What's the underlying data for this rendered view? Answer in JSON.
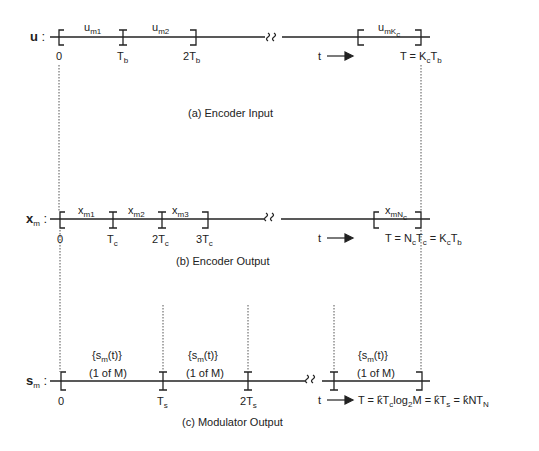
{
  "diagram": {
    "panels": [
      {
        "id": "a",
        "row_label": "u",
        "caption": "(a) Encoder Input",
        "segments": [
          "u_m1",
          "u_m2",
          "u_mKc"
        ],
        "ticks": [
          "0",
          "T_b",
          "2T_b"
        ],
        "end_formula": "T = K_c T_b",
        "time_label": "t"
      },
      {
        "id": "b",
        "row_label": "x_m",
        "caption": "(b) Encoder Output",
        "segments": [
          "x_m1",
          "x_m2",
          "x_m3",
          "x_mNc"
        ],
        "ticks": [
          "0",
          "T_c",
          "2T_c",
          "3T_c"
        ],
        "end_formula": "T = N_c T_c = K_c T_b",
        "time_label": "t"
      },
      {
        "id": "c",
        "row_label": "s_m",
        "caption": "(c) Modulator Output",
        "segments": [
          "{s_m(t)} (1 of M)",
          "{s_m(t)} (1 of M)",
          "{s_m(t)} (1 of M)"
        ],
        "ticks": [
          "0",
          "T_s",
          "2T_s"
        ],
        "end_formula": "T = k̂ T_c log_2 M = k̂ T_s = k̂ N T_N",
        "time_label": "t"
      }
    ],
    "text": {
      "u": "u",
      "colon": ":",
      "x": "x",
      "m": "m",
      "s": "s",
      "um": "u",
      "sub_m1": "m1",
      "sub_m2": "m2",
      "sub_m3": "m3",
      "sub_mKc_m": "mK",
      "sub_c": "c",
      "sub_mNc": "mN",
      "xm": "x",
      "zero": "0",
      "T": "T",
      "b": "b",
      "two": "2",
      "three": "3",
      "t": "t",
      "eq_a": "T = K",
      "eq_b1": "T = N",
      "eq_b2": " = K",
      "sm_open": "{s",
      "sm_close": "(t)}",
      "one_of_m": "(1 of M)",
      "eq_c1": "T = k̂T",
      "eq_c2": "log",
      "eq_c3": "M = k̂T",
      "eq_c4": " = k̂NT",
      "N": "N",
      "S": "s",
      "two_sub": "2",
      "cap_a": "(a) Encoder Input",
      "cap_b": "(b) Encoder Output",
      "cap_c": "(c) Modulator Output"
    }
  }
}
